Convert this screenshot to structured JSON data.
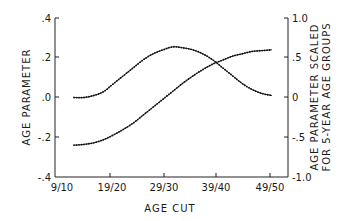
{
  "chart_data": {
    "type": "line",
    "title": "",
    "xlabel": "AGE CUT",
    "ylabel": "AGE PARAMETER",
    "ylabel_right": [
      "AGE PARAMETER SCALED",
      "FOR 5-YEAR AGE GROUPS"
    ],
    "ylim": [
      -0.4,
      0.4
    ],
    "ylim_right": [
      -1.0,
      1.0
    ],
    "x_tick_labels": [
      "9/10",
      "19/20",
      "29/30",
      "39/40",
      "49/50"
    ],
    "y_tick_labels": [
      ".4",
      ".2",
      ".0",
      "-.2",
      "-.4"
    ],
    "y_right_tick_labels": [
      "1.0",
      ".5",
      "0",
      "-.5",
      "-1.0"
    ],
    "grid": false,
    "legend": null,
    "x": [
      "9/10",
      "11/12",
      "13/14",
      "15/16",
      "17/18",
      "19/20",
      "21/22",
      "23/24",
      "25/26",
      "27/28",
      "29/30",
      "31/32",
      "33/34",
      "35/36",
      "37/38",
      "39/40",
      "41/42",
      "43/44",
      "45/46",
      "47/48",
      "49/50"
    ],
    "series": [
      {
        "name": "Age parameter (bell-shaped curve)",
        "axis": "left",
        "values": [
          0.0,
          0.0,
          0.01,
          0.03,
          0.07,
          0.11,
          0.15,
          0.19,
          0.22,
          0.24,
          0.255,
          0.25,
          0.24,
          0.22,
          0.19,
          0.15,
          0.11,
          0.07,
          0.04,
          0.02,
          0.01
        ]
      },
      {
        "name": "Age parameter scaled for 5-year age groups (S-shaped curve)",
        "axis": "right",
        "values": [
          -0.6,
          -0.59,
          -0.57,
          -0.53,
          -0.47,
          -0.4,
          -0.32,
          -0.22,
          -0.12,
          -0.02,
          0.08,
          0.18,
          0.27,
          0.35,
          0.42,
          0.47,
          0.52,
          0.55,
          0.58,
          0.59,
          0.6
        ]
      }
    ]
  }
}
